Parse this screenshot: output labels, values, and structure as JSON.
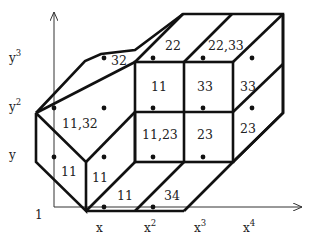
{
  "figure": {
    "type": "diagram",
    "colors": {
      "stroke": "#111111",
      "axis": "#333333",
      "text": "#222222",
      "background": "#ffffff"
    }
  },
  "axes": {
    "origin_label": "1",
    "x_ticks": [
      {
        "base": "x",
        "exp": ""
      },
      {
        "base": "x",
        "exp": "2"
      },
      {
        "base": "x",
        "exp": "3"
      },
      {
        "base": "x",
        "exp": "4"
      }
    ],
    "y_ticks": [
      {
        "base": "y",
        "exp": ""
      },
      {
        "base": "y",
        "exp": "2"
      },
      {
        "base": "y",
        "exp": "3"
      }
    ]
  },
  "cells": {
    "top_left_slant": "32",
    "top_mid": "22",
    "top_right": "22,33",
    "front_upper_left": "11",
    "front_upper_right": "33",
    "right_side_upper": "33",
    "left_hex": "11,32",
    "front_lower_left": "11,23",
    "front_lower_right": "23",
    "right_side_lower": "23",
    "left_face": "11",
    "left_inner_face": "11",
    "bottom_left": "11",
    "bottom_right": "34"
  }
}
